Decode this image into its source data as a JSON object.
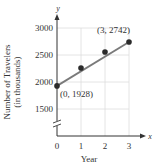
{
  "chart_data": {
    "type": "scatter",
    "title": "",
    "xlabel": "Year",
    "ylabel": "Number of Travelers",
    "ylabel_sub": "(in thousands)",
    "x_axis_name": "x",
    "y_axis_name": "y",
    "xlim": [
      0,
      3
    ],
    "ylim": [
      1500,
      3000
    ],
    "x_ticks": [
      "0",
      "1",
      "2",
      "3"
    ],
    "y_ticks": [
      "1500",
      "2000",
      "2500",
      "3000"
    ],
    "grid": true,
    "axis_break": true,
    "series": [
      {
        "name": "Travelers",
        "type": "scatter",
        "x": [
          0,
          1,
          2,
          3
        ],
        "y": [
          1928,
          2260,
          2556,
          2742
        ]
      },
      {
        "name": "Trend line",
        "type": "line",
        "x": [
          0,
          3
        ],
        "y": [
          1928,
          2742
        ]
      }
    ],
    "annotations": [
      {
        "text": "(0, 1928)",
        "x": 0,
        "y": 1928
      },
      {
        "text": "(3, 2742)",
        "x": 3,
        "y": 2742
      }
    ]
  },
  "colors": {
    "line": "#7a7a7a",
    "point": "#2b2b2b",
    "grid": "#dddddd",
    "axis": "#333333"
  }
}
